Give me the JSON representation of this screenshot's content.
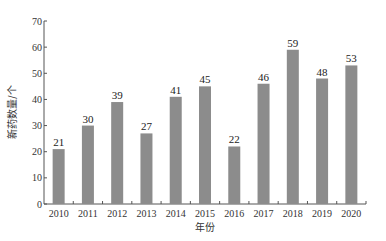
{
  "chart_data": {
    "type": "bar",
    "title": "",
    "xlabel": "年份",
    "ylabel": "新药数量/个",
    "categories": [
      "2010",
      "2011",
      "2012",
      "2013",
      "2014",
      "2015",
      "2016",
      "2017",
      "2018",
      "2019",
      "2020"
    ],
    "values": [
      21,
      30,
      39,
      27,
      41,
      45,
      22,
      46,
      59,
      48,
      53
    ],
    "ylim": [
      0,
      70
    ],
    "yticks": [
      0,
      10,
      20,
      30,
      40,
      50,
      60,
      70
    ],
    "grid": false,
    "legend": null,
    "bar_color": "#8c8c8c",
    "data_labels": true
  }
}
